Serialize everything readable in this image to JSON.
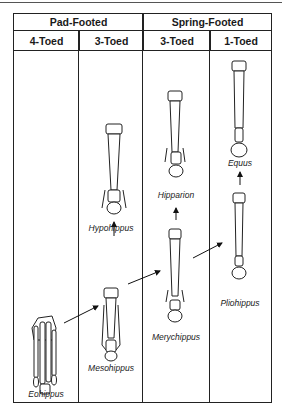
{
  "header": {
    "groups": [
      {
        "label": "Pad-Footed",
        "span": 2
      },
      {
        "label": "Spring-Footed",
        "span": 2
      }
    ],
    "columns": [
      {
        "label": "4-Toed"
      },
      {
        "label": "3-Toed"
      },
      {
        "label": "3-Toed"
      },
      {
        "label": "1-Toed"
      }
    ]
  },
  "specimens": [
    {
      "name": "Eohippus",
      "column": "4-Toed",
      "group": "Pad-Footed"
    },
    {
      "name": "Mesohippus",
      "column": "3-Toed",
      "group": "Pad-Footed"
    },
    {
      "name": "Hypohippus",
      "column": "3-Toed",
      "group": "Pad-Footed"
    },
    {
      "name": "Merychippus",
      "column": "3-Toed",
      "group": "Spring-Footed"
    },
    {
      "name": "Hipparion",
      "column": "3-Toed",
      "group": "Spring-Footed"
    },
    {
      "name": "Pliohippus",
      "column": "1-Toed",
      "group": "Spring-Footed"
    },
    {
      "name": "Equus",
      "column": "1-Toed",
      "group": "Spring-Footed"
    }
  ],
  "arrows": [
    {
      "from": "Eohippus",
      "to": "Mesohippus"
    },
    {
      "from": "Mesohippus",
      "to": "Hypohippus"
    },
    {
      "from": "Mesohippus",
      "to": "Merychippus"
    },
    {
      "from": "Merychippus",
      "to": "Hipparion"
    },
    {
      "from": "Merychippus",
      "to": "Pliohippus"
    },
    {
      "from": "Pliohippus",
      "to": "Equus"
    }
  ]
}
